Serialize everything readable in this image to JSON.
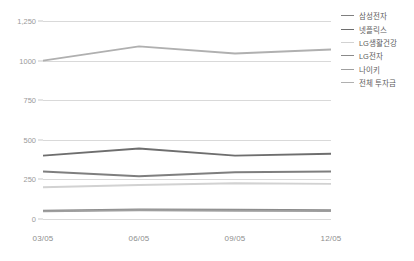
{
  "chart_data": {
    "type": "line",
    "title": "",
    "xlabel": "",
    "ylabel": "",
    "categories": [
      "03/05",
      "06/05",
      "09/05",
      "12/05"
    ],
    "ylim": [
      0,
      1250
    ],
    "yticks": [
      0,
      250,
      500,
      750,
      1000,
      1250
    ],
    "ytick_labels": [
      "0",
      "250",
      "500",
      "750",
      "1000",
      "1,250"
    ],
    "grid": true,
    "legend_position": "right",
    "series": [
      {
        "name": "삼성전자",
        "color": "#7f7f7f",
        "width": 1.9,
        "values": [
          300,
          270,
          295,
          300
        ]
      },
      {
        "name": "넷플릭스",
        "color": "#6e6e6e",
        "width": 1.9,
        "values": [
          400,
          445,
          400,
          412
        ]
      },
      {
        "name": "LG생활건강",
        "color": "#d2d2d2",
        "width": 1.9,
        "values": [
          200,
          215,
          226,
          222
        ]
      },
      {
        "name": "LG전자",
        "color": "#8a8a8a",
        "width": 1.9,
        "values": [
          52,
          60,
          58,
          55
        ]
      },
      {
        "name": "나이키",
        "color": "#9f9f9f",
        "width": 1.9,
        "values": [
          48,
          55,
          52,
          50
        ]
      },
      {
        "name": "전체 투자금",
        "color": "#b0b0b0",
        "width": 1.9,
        "values": [
          1000,
          1090,
          1045,
          1070
        ]
      }
    ]
  }
}
